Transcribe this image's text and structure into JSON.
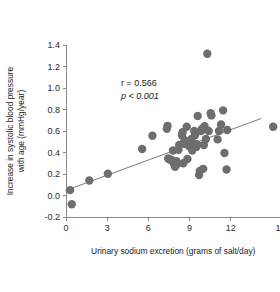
{
  "chart_data": {
    "type": "scatter",
    "title": "",
    "xlabel": "Urinary sodium excretion (grams of salt/day)",
    "ylabel_line1": "Increase in systolic blood pressure",
    "ylabel_line2": "with age (mmHg/year)",
    "xlim": [
      0,
      16
    ],
    "ylim": [
      -0.2,
      1.4
    ],
    "xticks": [
      0,
      3,
      6,
      9,
      12,
      16
    ],
    "xticklabels": [
      "0",
      "3",
      "6",
      "9",
      "12",
      "16"
    ],
    "yticks": [
      -0.2,
      0.0,
      0.2,
      0.4,
      0.6,
      0.8,
      1.0,
      1.2,
      1.4
    ],
    "yticklabels": [
      "-0.2",
      "0.0",
      "0.2",
      "0.4",
      "0.6",
      "0.8",
      "1.0",
      "1.2",
      "1.4"
    ],
    "grid": false,
    "legend": "none",
    "marker_color": "#6e6e6e",
    "marker_size": 4.2,
    "trendline": {
      "color": "#7a7a7a",
      "width": 1.0,
      "x_start": 0.0,
      "y_start": 0.048,
      "x_end": 14.2,
      "y_end": 0.715
    },
    "annotations": [
      {
        "text": "r = 0.566",
        "x": 4.0,
        "y": 1.02,
        "italic": false
      },
      {
        "text": "p < 0.001",
        "x": 4.0,
        "y": 0.9,
        "italic": true
      }
    ],
    "points": [
      [
        0.3,
        0.05
      ],
      [
        0.42,
        -0.082
      ],
      [
        1.7,
        0.14
      ],
      [
        3.05,
        0.202
      ],
      [
        5.55,
        0.432
      ],
      [
        6.3,
        0.556
      ],
      [
        7.35,
        0.62
      ],
      [
        7.4,
        0.648
      ],
      [
        7.45,
        0.345
      ],
      [
        7.55,
        0.335
      ],
      [
        7.7,
        0.33
      ],
      [
        7.8,
        0.418
      ],
      [
        7.85,
        0.3
      ],
      [
        7.95,
        0.268
      ],
      [
        8.05,
        0.318
      ],
      [
        8.1,
        0.292
      ],
      [
        8.2,
        0.425
      ],
      [
        8.25,
        0.47
      ],
      [
        8.45,
        0.56
      ],
      [
        8.5,
        0.588
      ],
      [
        8.55,
        0.3
      ],
      [
        8.6,
        0.49
      ],
      [
        8.65,
        0.515
      ],
      [
        8.7,
        0.478
      ],
      [
        8.8,
        0.64
      ],
      [
        8.85,
        0.34
      ],
      [
        8.95,
        0.48
      ],
      [
        9.0,
        0.455
      ],
      [
        9.05,
        0.5
      ],
      [
        9.15,
        0.525
      ],
      [
        9.2,
        0.418
      ],
      [
        9.3,
        0.468
      ],
      [
        9.35,
        0.6
      ],
      [
        9.4,
        0.56
      ],
      [
        9.5,
        0.452
      ],
      [
        9.55,
        0.478
      ],
      [
        9.6,
        0.74
      ],
      [
        9.7,
        0.19
      ],
      [
        9.75,
        0.228
      ],
      [
        9.85,
        0.6
      ],
      [
        9.9,
        0.62
      ],
      [
        10.0,
        0.248
      ],
      [
        10.05,
        0.47
      ],
      [
        10.1,
        0.645
      ],
      [
        10.2,
        0.525
      ],
      [
        10.3,
        1.318
      ],
      [
        10.4,
        0.6
      ],
      [
        10.55,
        0.765
      ],
      [
        10.6,
        0.745
      ],
      [
        11.05,
        0.522
      ],
      [
        11.15,
        0.6
      ],
      [
        11.3,
        0.66
      ],
      [
        11.45,
        0.792
      ],
      [
        11.55,
        0.395
      ],
      [
        11.7,
        0.242
      ],
      [
        11.75,
        0.61
      ],
      [
        15.1,
        0.64
      ]
    ]
  }
}
